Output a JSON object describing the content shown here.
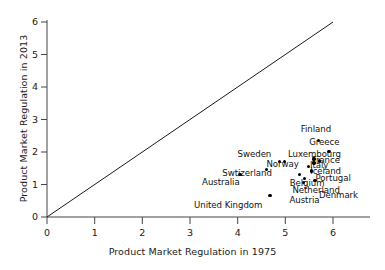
{
  "chart_data": {
    "type": "scatter",
    "title": "",
    "xlabel": "Product Market Regulation in 1975",
    "ylabel": "Product Market Regulation in 2013",
    "xlim": [
      0,
      6
    ],
    "ylim": [
      0,
      6
    ],
    "xticks": [
      "0",
      "1",
      "2",
      "3",
      "4",
      "5",
      "6"
    ],
    "yticks": [
      "0",
      "1",
      "2",
      "3",
      "4",
      "5",
      "6"
    ],
    "grid": false,
    "legend": "none",
    "annotations": [
      {
        "text": "45-degree reference line",
        "from": [
          0,
          0
        ],
        "to": [
          6,
          6
        ]
      }
    ],
    "points": [
      {
        "label": "Australia",
        "x": 4.05,
        "y": 1.3,
        "label_dx": -38,
        "label_dy": 11
      },
      {
        "label": "United Kingdom",
        "x": 4.68,
        "y": 0.67,
        "label_dx": -76,
        "label_dy": 14
      },
      {
        "label": "Sweden",
        "x": 4.88,
        "y": 1.7,
        "label_dx": -42,
        "label_dy": -4
      },
      {
        "label": "Swtizerland",
        "x": 4.6,
        "y": 1.47,
        "label_dx": -44,
        "label_dy": 8
      },
      {
        "label": "Norway",
        "x": 4.98,
        "y": 1.7,
        "label_dx": -18,
        "label_dy": 6
      },
      {
        "label": "Finland",
        "x": 5.7,
        "y": 2.35,
        "label_dx": -18,
        "label_dy": -8
      },
      {
        "label": "Greece",
        "x": 5.92,
        "y": 2.02,
        "label_dx": -20,
        "label_dy": -5
      },
      {
        "label": "Luxembourg",
        "x": 5.6,
        "y": 1.78,
        "label_dx": -26,
        "label_dy": -1
      },
      {
        "label": "France",
        "x": 5.72,
        "y": 1.72,
        "label_dx": -8,
        "label_dy": 3
      },
      {
        "label": "Italy",
        "x": 5.6,
        "y": 1.66,
        "label_dx": -4,
        "label_dy": 6
      },
      {
        "label": "Iceland",
        "x": 5.48,
        "y": 1.55,
        "label_dx": 2,
        "label_dy": 8
      },
      {
        "label": "Portugal",
        "x": 5.55,
        "y": 1.42,
        "label_dx": 4,
        "label_dy": 11
      },
      {
        "label": "Belgium",
        "x": 5.3,
        "y": 1.3,
        "label_dx": -10,
        "label_dy": 12
      },
      {
        "label": "Netherland",
        "x": 5.4,
        "y": 1.18,
        "label_dx": -12,
        "label_dy": 15
      },
      {
        "label": "Denmark",
        "x": 5.62,
        "y": 1.12,
        "label_dx": 4,
        "label_dy": 18
      },
      {
        "label": "Austria",
        "x": 5.38,
        "y": 1.06,
        "label_dx": -14,
        "label_dy": 21
      }
    ]
  },
  "axes": {
    "x_title": "Product Market Regulation in 1975",
    "y_title": "Product Market Regulation in 2013"
  }
}
